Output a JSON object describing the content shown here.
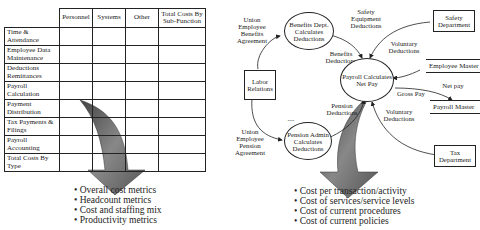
{
  "left_panel": {
    "table": {
      "columns": [
        "",
        "Personnel",
        "Systems",
        "Other",
        "Total Costs By Sub-Function"
      ],
      "rows": [
        "Time & Attendance",
        "Employee Data Maintenance",
        "Deductions Remittances",
        "Payroll Calculation",
        "Payment Distribution",
        "Tax Payments & Filings",
        "Payroll Accounting",
        "Total Costs By Type"
      ]
    },
    "bullets": [
      "Overall cost metrics",
      "Headcount metrics",
      "Cost and staffing mix",
      "Productivity metrics"
    ]
  },
  "right_panel": {
    "processes": {
      "benefits": "Benefits Dept. Calculates Deductions",
      "payroll": "Payroll Calculates Net Pay",
      "pension": "Pension Admin Calculates Deductions"
    },
    "entities": {
      "labor": "Labor Relations",
      "safety": "Safety Department",
      "tax": "Tax Department"
    },
    "stores": {
      "employee_master": "Employee Master",
      "payroll_master": "Payroll Master"
    },
    "flows": {
      "union_benefits": "Union Employee Benefits Agreement",
      "safety_equipment": "Safety Equipment Deductions",
      "benefits_deductions": "Benefits Deductions",
      "voluntary_top": "Voluntary Deductions",
      "gross_pay": "Gross Pay",
      "net_pay": "Net pay",
      "pension_deductions": "Pension Deductions",
      "voluntary_bottom": "Voluntary Deductions",
      "union_pension": "Union Employee Pension Agreement",
      "ellipsis": "...."
    },
    "bullets": [
      "Cost per transaction/activity",
      "Cost of services/service levels",
      "Cost of current procedures",
      "Cost of current policies"
    ]
  }
}
